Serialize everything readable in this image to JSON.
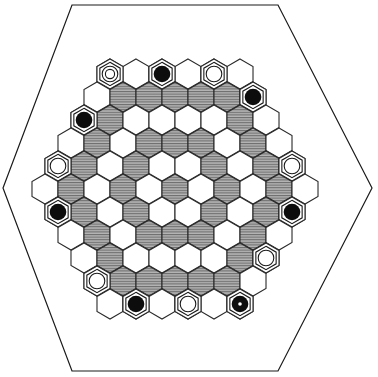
{
  "board": {
    "shape": "hexagon-of-hexagons",
    "radius": 5,
    "colors": {
      "white": "#ffffff",
      "hatched": "#9a9a9a",
      "line": "#2a2a2a",
      "black_piece": "#0d0d0d"
    },
    "legend": {
      "W": "plain cell",
      "H": "hatched cell"
    },
    "geometry": {
      "x_spacing": 26,
      "row_spacing": 23,
      "top_y": 74,
      "top_left_x": 110,
      "hex_radius": 15
    },
    "frame": {
      "points": "72,5 278,5 372,188 278,371 72,371 3,188"
    },
    "rows": [
      {
        "cells": [
          "W",
          "W",
          "W",
          "W",
          "W",
          "W"
        ],
        "pieces": [
          {
            "col": 0,
            "type": "double-ring"
          },
          {
            "col": 2,
            "type": "black"
          },
          {
            "col": 4,
            "type": "white"
          }
        ]
      },
      {
        "cells": [
          "W",
          "H",
          "H",
          "H",
          "H",
          "H",
          "W"
        ],
        "pieces": [
          {
            "col": 6,
            "type": "black"
          }
        ]
      },
      {
        "cells": [
          "W",
          "H",
          "W",
          "W",
          "W",
          "W",
          "H",
          "W"
        ],
        "pieces": [
          {
            "col": 0,
            "type": "black"
          }
        ]
      },
      {
        "cells": [
          "W",
          "H",
          "W",
          "H",
          "H",
          "H",
          "W",
          "H",
          "W"
        ],
        "pieces": []
      },
      {
        "cells": [
          "W",
          "H",
          "W",
          "H",
          "W",
          "W",
          "H",
          "W",
          "H",
          "W"
        ],
        "pieces": [
          {
            "col": 0,
            "type": "white"
          },
          {
            "col": 9,
            "type": "white"
          }
        ]
      },
      {
        "cells": [
          "W",
          "H",
          "W",
          "H",
          "W",
          "H",
          "W",
          "H",
          "W",
          "H",
          "W"
        ],
        "pieces": []
      },
      {
        "cells": [
          "W",
          "H",
          "W",
          "H",
          "W",
          "W",
          "H",
          "W",
          "H",
          "W"
        ],
        "pieces": [
          {
            "col": 0,
            "type": "black"
          },
          {
            "col": 9,
            "type": "black"
          }
        ]
      },
      {
        "cells": [
          "W",
          "H",
          "W",
          "H",
          "H",
          "H",
          "W",
          "H",
          "W"
        ],
        "pieces": []
      },
      {
        "cells": [
          "W",
          "H",
          "W",
          "W",
          "W",
          "W",
          "H",
          "W"
        ],
        "pieces": [
          {
            "col": 7,
            "type": "white"
          }
        ]
      },
      {
        "cells": [
          "W",
          "H",
          "H",
          "H",
          "H",
          "H",
          "W"
        ],
        "pieces": [
          {
            "col": 0,
            "type": "white"
          }
        ]
      },
      {
        "cells": [
          "W",
          "W",
          "W",
          "W",
          "W",
          "W"
        ],
        "pieces": [
          {
            "col": 1,
            "type": "black"
          },
          {
            "col": 3,
            "type": "white"
          },
          {
            "col": 5,
            "type": "black-dot"
          }
        ]
      }
    ]
  }
}
